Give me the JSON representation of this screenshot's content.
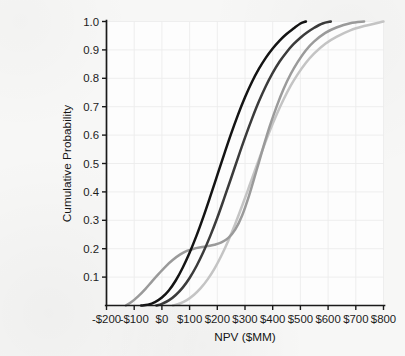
{
  "figure": {
    "background_color": "#f7f7f6",
    "panel_color": "#fdfdfd"
  },
  "chart_data": {
    "type": "line",
    "title": "",
    "subtitle": "",
    "xlabel": "NPV ($MM)",
    "ylabel": "Cumulative Probability",
    "xlim": [
      -200,
      800
    ],
    "ylim": [
      0.0,
      1.0
    ],
    "grid": true,
    "legend": "none",
    "x_tick_labels": [
      "-$200",
      "-$100",
      "$0",
      "$100",
      "$200",
      "$300",
      "$400",
      "$500",
      "$600",
      "$700",
      "$800"
    ],
    "x_tick_values": [
      -200,
      -100,
      0,
      100,
      200,
      300,
      400,
      500,
      600,
      700,
      800
    ],
    "y_tick_labels": [
      "0.1",
      "0.2",
      "0.3",
      "0.4",
      "0.5",
      "0.6",
      "0.7",
      "0.8",
      "0.9",
      "1.0"
    ],
    "y_tick_values": [
      0.1,
      0.2,
      0.3,
      0.4,
      0.5,
      0.6,
      0.7,
      0.8,
      0.9,
      1.0
    ],
    "series": [
      {
        "name": "Curve 1 (black)",
        "color": "#141414",
        "width": 2.5,
        "x": [
          -75,
          -50,
          -25,
          0,
          25,
          50,
          75,
          100,
          125,
          150,
          175,
          200,
          225,
          250,
          275,
          300,
          325,
          350,
          375,
          400,
          425,
          450,
          475,
          500,
          520
        ],
        "y": [
          0.0,
          0.003,
          0.012,
          0.028,
          0.053,
          0.088,
          0.133,
          0.186,
          0.246,
          0.313,
          0.385,
          0.459,
          0.533,
          0.605,
          0.672,
          0.733,
          0.787,
          0.833,
          0.872,
          0.905,
          0.933,
          0.956,
          0.975,
          0.993,
          1.0
        ]
      },
      {
        "name": "Curve 2 (dark gray)",
        "color": "#3b3b3b",
        "width": 2.5,
        "x": [
          -20,
          0,
          25,
          50,
          75,
          100,
          125,
          150,
          175,
          200,
          225,
          250,
          275,
          300,
          325,
          350,
          375,
          400,
          425,
          450,
          475,
          500,
          525,
          550,
          580,
          610
        ],
        "y": [
          0.0,
          0.006,
          0.018,
          0.037,
          0.063,
          0.097,
          0.139,
          0.189,
          0.246,
          0.309,
          0.378,
          0.449,
          0.521,
          0.591,
          0.657,
          0.718,
          0.772,
          0.819,
          0.859,
          0.892,
          0.92,
          0.943,
          0.962,
          0.978,
          0.993,
          1.0
        ]
      },
      {
        "name": "Curve 3 (medium gray, bimodal)",
        "color": "#9a9a9a",
        "width": 2.5,
        "x": [
          -130,
          -110,
          -85,
          -60,
          -35,
          -10,
          15,
          40,
          65,
          90,
          115,
          140,
          165,
          190,
          215,
          240,
          265,
          290,
          315,
          340,
          365,
          390,
          415,
          440,
          465,
          490,
          520,
          550,
          590,
          630,
          680,
          730
        ],
        "y": [
          0.0,
          0.012,
          0.033,
          0.058,
          0.086,
          0.113,
          0.139,
          0.161,
          0.179,
          0.192,
          0.2,
          0.205,
          0.209,
          0.214,
          0.222,
          0.238,
          0.268,
          0.318,
          0.388,
          0.47,
          0.554,
          0.633,
          0.703,
          0.764,
          0.815,
          0.857,
          0.899,
          0.93,
          0.96,
          0.979,
          0.994,
          1.0
        ]
      },
      {
        "name": "Curve 4 (light gray)",
        "color": "#c4c4c4",
        "width": 2.5,
        "x": [
          40,
          65,
          90,
          115,
          140,
          165,
          190,
          215,
          240,
          265,
          290,
          315,
          340,
          365,
          390,
          415,
          440,
          465,
          490,
          520,
          550,
          590,
          630,
          680,
          730,
          800
        ],
        "y": [
          0.0,
          0.007,
          0.019,
          0.037,
          0.061,
          0.092,
          0.13,
          0.176,
          0.229,
          0.288,
          0.352,
          0.419,
          0.487,
          0.553,
          0.616,
          0.674,
          0.727,
          0.774,
          0.814,
          0.855,
          0.888,
          0.922,
          0.946,
          0.969,
          0.984,
          1.0
        ]
      }
    ]
  }
}
